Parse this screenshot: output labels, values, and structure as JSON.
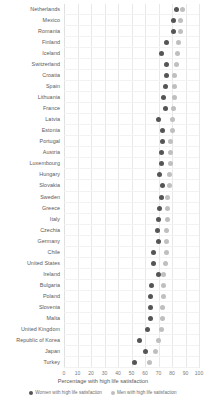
{
  "chart_data": {
    "type": "scatter",
    "title": "",
    "xlabel": "Percentage with high life satisfaction",
    "ylabel": "",
    "xlim": [
      0,
      100
    ],
    "xticks": [
      0,
      10,
      20,
      30,
      40,
      50,
      60,
      70,
      80,
      90,
      100
    ],
    "grid": true,
    "legend_position": "bottom",
    "orientation": "horizontal",
    "colors": {
      "series_0": "#555555",
      "series_1": "#bfbfbf",
      "gridline": "#e8e8e8",
      "text": "#595959"
    },
    "categories": [
      "Netherlands",
      "Mexico",
      "Romania",
      "Finland",
      "Iceland",
      "Switzerland",
      "Croatia",
      "Spain",
      "Lithuania",
      "France",
      "Latvia",
      "Estonia",
      "Portugal",
      "Austria",
      "Luxembourg",
      "Hungary",
      "Slovakia",
      "Sweden",
      "Greece",
      "Italy",
      "Czechia",
      "Germany",
      "Chile",
      "United States",
      "Ireland",
      "Bulgaria",
      "Poland",
      "Slovenia",
      "Malta",
      "United Kingdom",
      "Republic of Korea",
      "Japan",
      "Turkey"
    ],
    "series": [
      {
        "name": "Women with high life satisfaction",
        "color": "#555555",
        "values": [
          83,
          81,
          81,
          76,
          72,
          76,
          76,
          75,
          74,
          75,
          70,
          73,
          73,
          72,
          72,
          71,
          73,
          72,
          71,
          70,
          69,
          70,
          66,
          66,
          70,
          65,
          64,
          64,
          64,
          62,
          56,
          60,
          52
        ]
      },
      {
        "name": "Men with high life satisfaction",
        "color": "#bfbfbf",
        "values": [
          88,
          86,
          86,
          85,
          84,
          83,
          82,
          82,
          82,
          81,
          80,
          80,
          79,
          79,
          79,
          78,
          78,
          77,
          77,
          77,
          76,
          76,
          76,
          75,
          74,
          74,
          74,
          73,
          73,
          72,
          70,
          68,
          63
        ]
      }
    ]
  },
  "legend": {
    "items": [
      {
        "label": "Women with high life satisfaction",
        "color": "#555555"
      },
      {
        "label": "Men with high life satisfaction",
        "color": "#bfbfbf"
      }
    ]
  }
}
